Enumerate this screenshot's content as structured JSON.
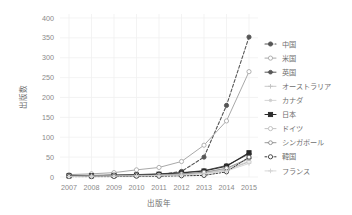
{
  "chart_data": {
    "type": "line",
    "title": "",
    "xlabel": "出版年",
    "ylabel": "出版数",
    "x": [
      2007,
      2008,
      2009,
      2010,
      2011,
      2012,
      2013,
      2014,
      2015
    ],
    "xticklabels": [
      "2007",
      "2008",
      "2009",
      "2010",
      "2011",
      "2012",
      "2013",
      "2014",
      "2015"
    ],
    "yticklabels": [
      "0",
      "50",
      "100",
      "150",
      "200",
      "250",
      "300",
      "350",
      "400"
    ],
    "yticks": [
      0,
      50,
      100,
      150,
      200,
      250,
      300,
      350,
      400
    ],
    "ylim": [
      0,
      410
    ],
    "xlim": [
      2006.6,
      2015.4
    ],
    "grid": true,
    "legend_position": "right",
    "series": [
      {
        "name": "中国",
        "values": [
          2,
          2,
          3,
          4,
          6,
          14,
          50,
          180,
          352
        ],
        "color": "#555555",
        "dash": "3,2",
        "marker": "circle",
        "marker_filled": true,
        "width": 1.1
      },
      {
        "name": "米国",
        "values": [
          6,
          8,
          11,
          18,
          24,
          39,
          80,
          141,
          265
        ],
        "color": "#a9a9a9",
        "dash": "none",
        "marker": "circle",
        "marker_filled": false,
        "width": 1.0
      },
      {
        "name": "英国",
        "values": [
          4,
          4,
          5,
          6,
          8,
          11,
          16,
          29,
          58
        ],
        "color": "#585858",
        "dash": "none",
        "marker": "star",
        "marker_filled": true,
        "width": 1.0
      },
      {
        "name": "オーストラリア",
        "values": [
          2,
          2,
          3,
          4,
          5,
          7,
          11,
          20,
          45
        ],
        "color": "#c2c2c2",
        "dash": "none",
        "marker": "plus",
        "marker_filled": false,
        "width": 0.9
      },
      {
        "name": "カナダ",
        "values": [
          2,
          2,
          3,
          3,
          4,
          6,
          10,
          18,
          40
        ],
        "color": "#cfcfcf",
        "dash": "none",
        "marker": "dot",
        "marker_filled": false,
        "width": 0.9
      },
      {
        "name": "日本",
        "values": [
          3,
          3,
          4,
          5,
          7,
          10,
          15,
          27,
          61
        ],
        "color": "#2b2b2b",
        "dash": "none",
        "marker": "square",
        "marker_filled": true,
        "width": 1.1
      },
      {
        "name": "ドイツ",
        "values": [
          2,
          2,
          3,
          3,
          4,
          6,
          9,
          17,
          38
        ],
        "color": "#bdbdbd",
        "dash": "none",
        "marker": "circle",
        "marker_filled": false,
        "width": 0.9
      },
      {
        "name": "シンガポール",
        "values": [
          2,
          2,
          3,
          4,
          5,
          8,
          12,
          22,
          47
        ],
        "color": "#8f8f8f",
        "dash": "none",
        "marker": "circle-bar",
        "marker_filled": false,
        "width": 0.9
      },
      {
        "name": "韓国",
        "values": [
          1,
          1,
          1,
          2,
          2,
          3,
          4,
          13,
          50
        ],
        "color": "#3a3a3a",
        "dash": "1.6,1.6",
        "marker": "circle",
        "marker_filled": false,
        "width": 1.0
      },
      {
        "name": "フランス",
        "values": [
          1,
          2,
          2,
          3,
          4,
          5,
          8,
          15,
          34
        ],
        "color": "#d2d2d2",
        "dash": "none",
        "marker": "plus",
        "marker_filled": false,
        "width": 0.9
      }
    ]
  }
}
